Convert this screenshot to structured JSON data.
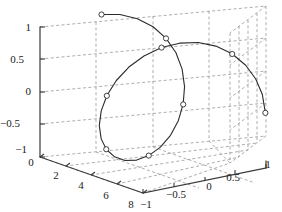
{
  "figure": {
    "kind": "matlab-3d-plot",
    "background": "#ffffff",
    "axis_color": "#3a3a3a",
    "grid_color": "#808080",
    "curve_color": "#2b2b2b",
    "marker_edge_color": "#2b2b2b",
    "marker_face_color": "#ffffff"
  },
  "chart_data": {
    "type": "line",
    "title": "",
    "xlabel": "",
    "ylabel": "",
    "zlabel": "",
    "grid": true,
    "legend": null,
    "projection": "3d",
    "axes": {
      "x": {
        "label": "",
        "ticks": [
          0,
          2,
          4,
          6,
          8
        ],
        "ticklabels": [
          "0",
          "2",
          "4",
          "6",
          "8"
        ],
        "lim": [
          0,
          8
        ]
      },
      "y": {
        "label": "",
        "ticks": [
          -1,
          -0.5,
          0,
          0.5,
          1
        ],
        "ticklabels": [
          "−1",
          "−0.5",
          "0",
          "0.5",
          "1"
        ],
        "lim": [
          -1,
          1
        ]
      },
      "z": {
        "label": "",
        "ticks": [
          -1,
          -0.5,
          0,
          0.5,
          1
        ],
        "ticklabels": [
          "−1",
          "−0.5",
          "0",
          "0.5",
          "1"
        ],
        "lim": [
          -1,
          1
        ]
      }
    },
    "series": [
      {
        "name": "helix",
        "style": "line-with-circle-markers",
        "x": [
          0.0,
          0.25,
          0.5,
          0.75,
          1.0,
          1.25,
          1.5,
          1.75,
          2.0,
          2.25,
          2.5,
          2.75,
          3.0,
          3.25,
          3.5,
          3.75,
          4.0,
          4.25,
          4.5,
          4.75,
          5.0,
          5.25,
          5.5,
          5.75,
          6.0,
          6.25,
          6.5,
          6.75,
          7.0,
          7.25,
          7.5,
          7.75,
          8.0
        ],
        "y": [
          0.0,
          0.247,
          0.479,
          0.682,
          0.841,
          0.949,
          0.997,
          0.984,
          0.909,
          0.778,
          0.599,
          0.382,
          0.141,
          -0.108,
          -0.351,
          -0.572,
          -0.757,
          -0.895,
          -0.978,
          -0.999,
          -0.959,
          -0.858,
          -0.706,
          -0.513,
          -0.279,
          -0.038,
          0.215,
          0.447,
          0.657,
          0.827,
          0.938,
          0.993,
          0.989
        ],
        "z": [
          1.0,
          0.969,
          0.878,
          0.732,
          0.54,
          0.315,
          0.071,
          -0.178,
          -0.416,
          -0.628,
          -0.801,
          -0.924,
          -0.99,
          -0.994,
          -0.936,
          -0.82,
          -0.654,
          -0.447,
          -0.211,
          0.038,
          0.284,
          0.513,
          0.708,
          0.858,
          0.96,
          0.999,
          0.977,
          0.895,
          0.754,
          0.562,
          0.347,
          0.115,
          -0.146
        ],
        "markers": [
          {
            "x": 0.0,
            "y": 0.0,
            "z": 1.0
          },
          {
            "x": 1.0,
            "y": 0.84,
            "z": 0.54
          },
          {
            "x": 2.0,
            "y": 0.91,
            "z": -0.42
          },
          {
            "x": 3.0,
            "y": 0.14,
            "z": -0.99
          },
          {
            "x": 4.0,
            "y": -0.76,
            "z": -0.65
          },
          {
            "x": 5.0,
            "y": -0.96,
            "z": 0.28
          },
          {
            "x": 6.0,
            "y": -0.28,
            "z": 0.96
          },
          {
            "x": 7.0,
            "y": 0.66,
            "z": 0.75
          },
          {
            "x": 8.0,
            "y": 0.99,
            "z": -0.15
          }
        ]
      }
    ]
  },
  "ticks": {
    "z": [
      {
        "text": "1",
        "x": 31,
        "y": 31
      },
      {
        "text": "0.5",
        "x": 24,
        "y": 63
      },
      {
        "text": "0",
        "x": 31,
        "y": 95
      },
      {
        "text": "−0.5",
        "x": 20,
        "y": 127
      },
      {
        "text": "−1",
        "x": 27,
        "y": 153
      }
    ],
    "x": [
      {
        "text": "0",
        "x": 31,
        "y": 166
      },
      {
        "text": "2",
        "x": 56,
        "y": 179
      },
      {
        "text": "4",
        "x": 81,
        "y": 189
      },
      {
        "text": "6",
        "x": 106,
        "y": 199
      },
      {
        "text": "8",
        "x": 131,
        "y": 208
      }
    ],
    "y": [
      {
        "text": "−1",
        "x": 146,
        "y": 208
      },
      {
        "text": "−0.5",
        "x": 176,
        "y": 198
      },
      {
        "text": "0",
        "x": 209,
        "y": 190
      },
      {
        "text": "0.5",
        "x": 233,
        "y": 181
      },
      {
        "text": "1",
        "x": 268,
        "y": 168
      }
    ]
  }
}
